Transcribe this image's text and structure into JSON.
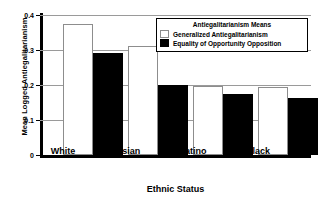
{
  "chart_data": {
    "type": "bar",
    "title": "",
    "xlabel": "Ethnic Status",
    "ylabel": "Mean Logged Antiegalitarianism",
    "categories": [
      "White",
      "Asian",
      "Latino",
      "Black"
    ],
    "series": [
      {
        "name": "Generalized Antiegalitarianism",
        "values": [
          0.374,
          0.311,
          0.197,
          0.193
        ],
        "color": "#ffffff"
      },
      {
        "name": "Equality of Opportunity Opposition",
        "values": [
          0.292,
          0.201,
          0.173,
          0.162
        ],
        "color": "#000000"
      }
    ],
    "ylim": [
      0,
      0.4
    ],
    "yticks": [
      "0",
      "0.1",
      "0.2",
      "0.3",
      "0.4"
    ],
    "ytick_values": [
      0,
      0.1,
      0.2,
      0.3,
      0.4
    ],
    "grid": true,
    "legend_position": "top-right",
    "legend_title": "Antiegalitarianism Means"
  }
}
